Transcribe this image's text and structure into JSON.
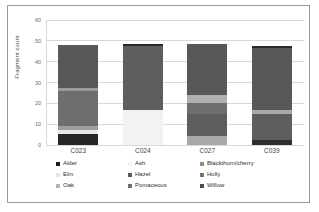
{
  "chart_data": {
    "type": "bar",
    "subtype": "stacked-bar",
    "title": "",
    "xlabel": "",
    "ylabel": "Fragment count",
    "ylim": [
      0,
      60
    ],
    "yticks": [
      0,
      10,
      20,
      30,
      40,
      50,
      60
    ],
    "grid": true,
    "legend_position": "bottom",
    "legend_columns": 3,
    "categories": [
      "C023",
      "C024",
      "C027",
      "C039"
    ],
    "series": [
      {
        "name": "Alder",
        "color": "#1a1a1a",
        "values": [
          5.5,
          0,
          0,
          2.5
        ]
      },
      {
        "name": "Ash",
        "color": "#f2f2f2",
        "values": [
          0,
          17,
          0,
          0
        ]
      },
      {
        "name": "Blackthorn/cherry",
        "color": "#8c8c8c",
        "values": [
          0,
          0,
          0,
          0
        ]
      },
      {
        "name": "Elm",
        "color": "#e6e6e6",
        "values": [
          1.5,
          0,
          0,
          0
        ]
      },
      {
        "name": "Hazel",
        "color": "#595959",
        "values": [
          2,
          0,
          10.5,
          12.5
        ]
      },
      {
        "name": "Holly",
        "color": "#737373",
        "values": [
          0,
          0,
          5,
          0
        ]
      },
      {
        "name": "Oak",
        "color": "#b3b3b3",
        "values": [
          0,
          0,
          4.5,
          2
        ]
      },
      {
        "name": "Pomaceous",
        "color": "#6e6e6e",
        "values": [
          17,
          0,
          4.5,
          0
        ]
      },
      {
        "name": "Willow",
        "color": "#4d4d4d",
        "values": [
          22,
          31,
          24,
          30
        ]
      }
    ],
    "bar_totals": [
      48,
      48,
      48.5,
      47
    ],
    "bars": [
      {
        "category": "C023",
        "total": 48,
        "segments": [
          {
            "name": "Alder",
            "value": 5.5,
            "color": "#262626"
          },
          {
            "name": "Elm",
            "value": 1.5,
            "color": "#e8e8e8"
          },
          {
            "name": "Hazel",
            "value": 2,
            "color": "#9e9e9e"
          },
          {
            "name": "Pomaceous",
            "value": 17,
            "color": "#6e6e6e"
          },
          {
            "name": "Oak",
            "value": 1.5,
            "color": "#9b9b9b"
          },
          {
            "name": "Willow",
            "value": 20.5,
            "color": "#585858"
          }
        ]
      },
      {
        "category": "C024",
        "total": 48.5,
        "segments": [
          {
            "name": "Ash",
            "value": 17,
            "color": "#f2f2f2"
          },
          {
            "name": "Willow",
            "value": 30.5,
            "color": "#5e5e5e"
          },
          {
            "name": "Alder",
            "value": 1,
            "color": "#2b2b2b"
          }
        ]
      },
      {
        "category": "C027",
        "total": 48.5,
        "segments": [
          {
            "name": "Oak",
            "value": 4.5,
            "color": "#a8a8a8"
          },
          {
            "name": "Hazel",
            "value": 10.5,
            "color": "#5e5e5e"
          },
          {
            "name": "Holly",
            "value": 5,
            "color": "#6e6e6e"
          },
          {
            "name": "Pomaceous",
            "value": 4,
            "color": "#b0b0b0"
          },
          {
            "name": "Willow",
            "value": 24.5,
            "color": "#585858"
          }
        ]
      },
      {
        "category": "C039",
        "total": 47.5,
        "segments": [
          {
            "name": "Alder",
            "value": 2.5,
            "color": "#2e2e2e"
          },
          {
            "name": "Hazel",
            "value": 12.5,
            "color": "#5e5e5e"
          },
          {
            "name": "Oak",
            "value": 2,
            "color": "#a8a8a8"
          },
          {
            "name": "Willow",
            "value": 29.5,
            "color": "#585858"
          },
          {
            "name": "Alder",
            "value": 1,
            "color": "#2b2b2b"
          }
        ]
      }
    ]
  }
}
